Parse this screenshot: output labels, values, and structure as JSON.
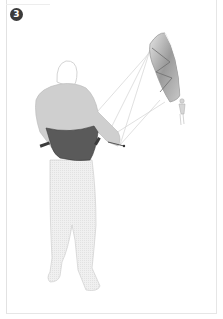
{
  "figure": {
    "step_number": "3",
    "colors": {
      "badge": "#3b3b3b",
      "harness": "#5a5a5a",
      "shirt": "#cfcfcf",
      "trousers": "#ececec",
      "kite_light": "#d8d8d8",
      "kite_dark": "#7a7a7a",
      "lines": "#cfcfcf",
      "frame_border": "#e2e2e2"
    }
  }
}
